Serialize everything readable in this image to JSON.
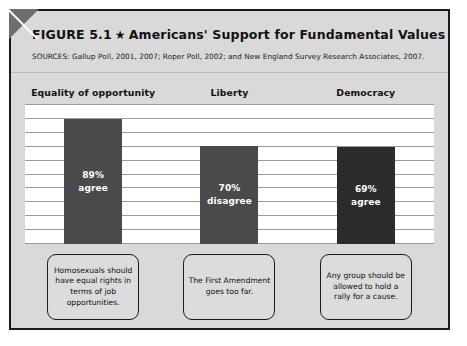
{
  "figure": {
    "label": "FIGURE 5.1",
    "star": "★",
    "title": "Americans' Support for Fundamental Values",
    "sources": "SOURCES: Gallup Poll, 2001, 2007; Roper Poll, 2002; and New England Survey Research Associates, 2007."
  },
  "colors": {
    "frame_border": "#1b1b1b",
    "header_background": "#d9d9d9",
    "panel_background": "#ffffff",
    "gridline": "#9a9a9a",
    "bar_light": "#4a4a4a",
    "bar_dark": "#2b2b2b",
    "caption_background": "#dcdcdc",
    "corner_fold": "#6e6e6e"
  },
  "chart_data": {
    "type": "bar",
    "title": "Americans' Support for Fundamental Values",
    "xlabel": "",
    "ylabel": "",
    "ylim": [
      0,
      100
    ],
    "grid": true,
    "gridline_count": 11,
    "legend": "none",
    "categories": [
      "Equality of opportunity",
      "Liberty",
      "Democracy"
    ],
    "values": [
      89,
      70,
      69
    ],
    "bars": [
      {
        "category": "Equality of opportunity",
        "value": 89,
        "percent_label": "89%",
        "response_label": "agree",
        "color": "#4a4a4a",
        "statement": "Homosexuals should have equal rights in terms of job opportunities."
      },
      {
        "category": "Liberty",
        "value": 70,
        "percent_label": "70%",
        "response_label": "disagree",
        "color": "#4a4a4a",
        "statement": "The First Amendment goes too far."
      },
      {
        "category": "Democracy",
        "value": 69,
        "percent_label": "69%",
        "response_label": "agree",
        "color": "#2b2b2b",
        "statement": "Any group should be allowed to hold a rally for a cause."
      }
    ]
  }
}
